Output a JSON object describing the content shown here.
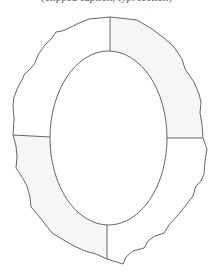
{
  "caption": {
    "text": "(clipped caption, typ. section)",
    "clipped": true
  },
  "diagram": {
    "type": "segmented-ring",
    "stroke_color": "#555555",
    "segments": [
      {
        "id": "top-left",
        "fill": "#ffffff"
      },
      {
        "id": "top-right",
        "fill": "#f6f6f6"
      },
      {
        "id": "bottom-right",
        "fill": "#ffffff"
      },
      {
        "id": "bottom-left",
        "fill": "#f6f6f6"
      }
    ],
    "inner_ellipse": {
      "cx": 108.5,
      "cy": 138,
      "rx": 58.5,
      "ry": 87
    }
  }
}
